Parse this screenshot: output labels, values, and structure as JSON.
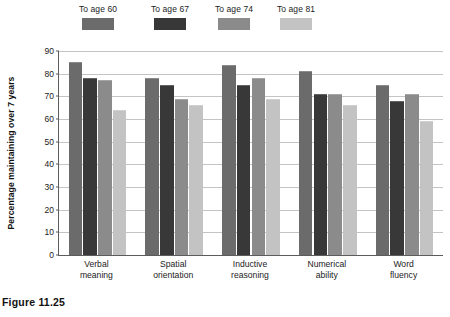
{
  "caption": "Figure 11.25",
  "chart_data": {
    "type": "bar",
    "title": "",
    "xlabel": "",
    "ylabel": "Percentage maintaining over 7 years",
    "ylim": [
      0,
      90
    ],
    "ytick_step": 10,
    "yticks": [
      "90",
      "80",
      "70",
      "60",
      "50",
      "40",
      "30",
      "20",
      "10",
      "0"
    ],
    "grid": true,
    "legend_position": "top-left",
    "categories": [
      "Verbal meaning",
      "Spatial orientation",
      "Inductive reasoning",
      "Numerical ability",
      "Word fluency"
    ],
    "category_lines": [
      [
        "Verbal",
        "meaning"
      ],
      [
        "Spatial",
        "orientation"
      ],
      [
        "Inductive",
        "reasoning"
      ],
      [
        "Numerical",
        "ability"
      ],
      [
        "Word",
        "fluency"
      ]
    ],
    "series": [
      {
        "name": "To age 60",
        "color": "#6b6b6b",
        "values": [
          85,
          78,
          84,
          81,
          75
        ]
      },
      {
        "name": "To age 67",
        "color": "#383838",
        "values": [
          78,
          75,
          75,
          71,
          68
        ]
      },
      {
        "name": "To age 74",
        "color": "#8b8b8b",
        "values": [
          77,
          69,
          78,
          71,
          71
        ]
      },
      {
        "name": "To age 81",
        "color": "#c3c3c3",
        "values": [
          64,
          66,
          69,
          66,
          59
        ]
      }
    ]
  }
}
